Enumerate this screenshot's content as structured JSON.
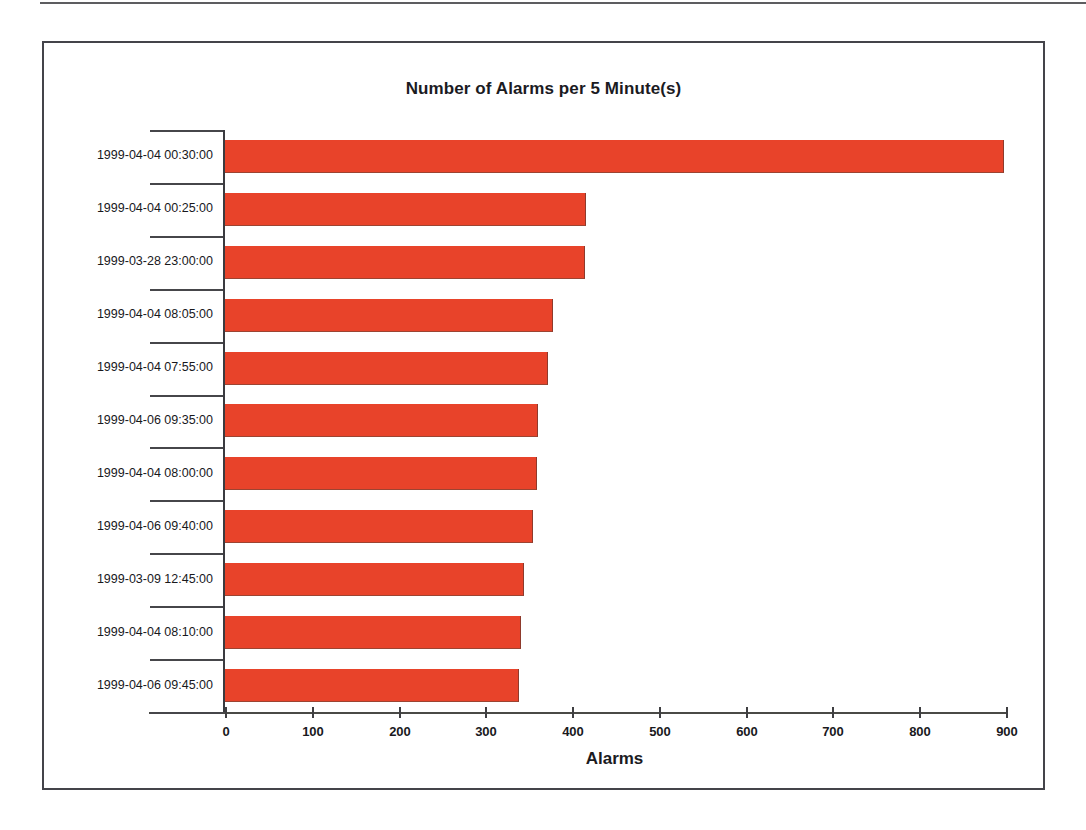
{
  "page": {
    "background_color": "#ffffff",
    "top_rule": "horizontal-rule"
  },
  "chart_frame": {
    "border_color": "#44444a"
  },
  "chart_data": {
    "type": "bar",
    "orientation": "horizontal",
    "title": "Number of Alarms per 5 Minute(s)",
    "xlabel": "Alarms",
    "ylabel": "",
    "xlim": [
      0,
      900
    ],
    "xticks": [
      0,
      100,
      200,
      300,
      400,
      500,
      600,
      700,
      800,
      900
    ],
    "grid": false,
    "legend": false,
    "bar_color": "#e8432a",
    "categories": [
      "1999-04-04 00:30:00",
      "1999-04-04 00:25:00",
      "1999-03-28 23:00:00",
      "1999-04-04 08:05:00",
      "1999-04-04 07:55:00",
      "1999-04-06 09:35:00",
      "1999-04-04 08:00:00",
      "1999-04-06 09:40:00",
      "1999-03-09 12:45:00",
      "1999-04-04 08:10:00",
      "1999-04-06 09:45:00"
    ],
    "values": [
      898,
      416,
      415,
      378,
      372,
      361,
      360,
      355,
      345,
      341,
      339
    ]
  }
}
